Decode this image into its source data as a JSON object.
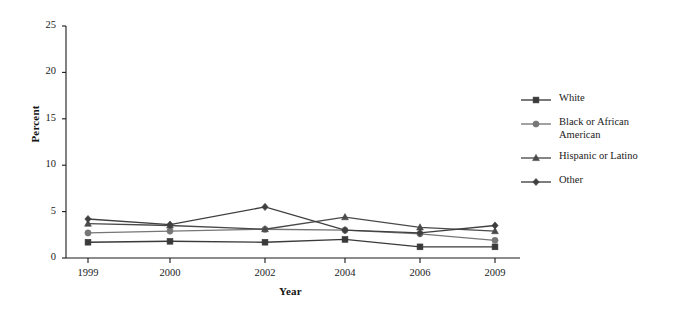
{
  "chart_data": {
    "type": "line",
    "title": "",
    "xlabel": "Year",
    "ylabel": "Percent",
    "categories": [
      "1999",
      "2000",
      "2002",
      "2004",
      "2006",
      "2009"
    ],
    "x": [
      1999,
      2000,
      2002,
      2004,
      2006,
      2009
    ],
    "ylim": [
      0,
      25
    ],
    "yticks": [
      0,
      5,
      10,
      15,
      20,
      25
    ],
    "ytick_labels": [
      "0",
      "5",
      "10",
      "15",
      "20",
      "25"
    ],
    "xtick_labels": [
      "1999",
      "2000",
      "2002",
      "2004",
      "2006",
      "2009"
    ],
    "grid": false,
    "legend_position": "right",
    "series": [
      {
        "name": "White",
        "marker": "square",
        "color": "#3a3a3a",
        "values": [
          1.7,
          1.8,
          1.7,
          2.0,
          1.2,
          1.2
        ]
      },
      {
        "name": "Black or African American",
        "marker": "circle",
        "color": "#767676",
        "values": [
          2.7,
          2.9,
          3.1,
          3.0,
          2.6,
          1.9
        ]
      },
      {
        "name": "Hispanic or Latino",
        "marker": "triangle",
        "color": "#4a4a4a",
        "values": [
          3.7,
          3.5,
          3.1,
          4.4,
          3.3,
          2.9
        ]
      },
      {
        "name": "Other",
        "marker": "diamond",
        "color": "#3f3f3f",
        "values": [
          4.2,
          3.6,
          5.5,
          3.0,
          2.7,
          3.5
        ]
      }
    ]
  },
  "legend": {
    "items": [
      {
        "label": "White",
        "marker": "square",
        "color": "#3a3a3a"
      },
      {
        "label": "Black or African American",
        "marker": "circle",
        "color": "#767676"
      },
      {
        "label": "Hispanic or Latino",
        "marker": "triangle",
        "color": "#4a4a4a"
      },
      {
        "label": "Other",
        "marker": "diamond",
        "color": "#3f3f3f"
      }
    ]
  },
  "axes": {
    "x_title": "Year",
    "y_title": "Percent"
  }
}
